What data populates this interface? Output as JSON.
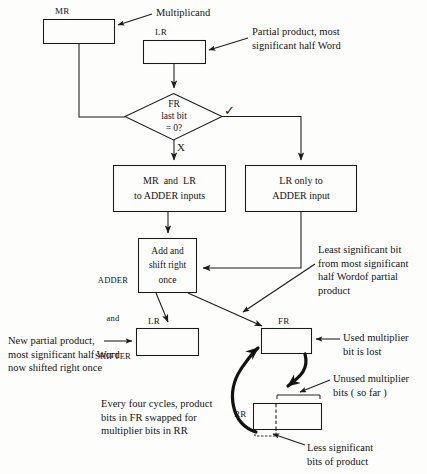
{
  "diagram": {
    "colors": {
      "stroke": "#1a1a1a",
      "background": "#fdfdfc",
      "text": "#141414"
    },
    "registers": {
      "mr_tag": "MR",
      "lr_top_tag": "LR",
      "lr_bottom_tag": "LR",
      "fr_tag": "FR",
      "rr_tag": "RR"
    },
    "decision": {
      "line1": "FR",
      "line2": "last bit",
      "line3": "= 0?",
      "true_mark": "✓",
      "false_mark": "X"
    },
    "process_boxes": [
      {
        "line1": "MR  and  LR",
        "line2": "to ADDER inputs"
      },
      {
        "line1": "LR only to",
        "line2": "ADDER input"
      },
      {
        "line1": "Add and",
        "line2": "shift right",
        "line3": "once"
      }
    ],
    "unit_label": {
      "line1": "ADDER",
      "line2": "and",
      "line3": "SHIFTER"
    },
    "annotations": [
      {
        "name": "multiplicand-note",
        "lines": [
          "Multiplicand"
        ]
      },
      {
        "name": "partial-product-note",
        "lines": [
          "Partial product, most",
          "significant half Word"
        ]
      },
      {
        "name": "least-significant-bit-note",
        "lines": [
          "Least significant bit",
          "from most significant",
          "half Wordof partial",
          "product"
        ]
      },
      {
        "name": "new-partial-product-note",
        "lines": [
          "New partial product,",
          "most significant half Word",
          "now shifted right once"
        ]
      },
      {
        "name": "used-multiplier-bit-note",
        "lines": [
          "Used multiplier",
          "bit is lost"
        ]
      },
      {
        "name": "unused-multiplier-bits-note",
        "lines": [
          "Unused multiplier",
          "bits ( so far )"
        ]
      },
      {
        "name": "swap-cycle-note",
        "lines": [
          "Every four cycles, product",
          "bits in FR swapped for",
          "multiplier bits in RR"
        ]
      },
      {
        "name": "less-significant-bits-note",
        "lines": [
          "Less significant",
          "bits of product"
        ]
      }
    ]
  }
}
